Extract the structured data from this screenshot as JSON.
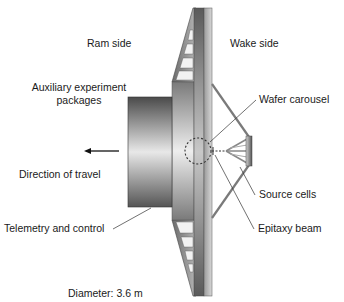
{
  "diagram": {
    "labels": {
      "ram_side": "Ram side",
      "wake_side": "Wake side",
      "aux_line1": "Auxiliary experiment",
      "aux_line2": "packages",
      "direction": "Direction of travel",
      "telemetry": "Telemetry and control",
      "wafer": "Wafer carousel",
      "source": "Source cells",
      "epitaxy": "Epitaxy beam",
      "diameter": "Diameter: 3.6 m"
    },
    "colors": {
      "text": "#1a1a1a",
      "metal_dark": "#5a5a5a",
      "metal_mid": "#9a9a9a",
      "metal_light": "#e6e6e6",
      "leader": "#333333"
    }
  }
}
